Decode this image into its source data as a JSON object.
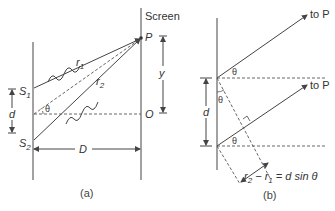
{
  "diagram_a": {
    "caption": "(a)",
    "screen_label": "Screen",
    "point_p": "P",
    "point_o": "O",
    "source_1": "S",
    "source_1_sub": "1",
    "source_2": "S",
    "source_2_sub": "2",
    "ray_1": "r",
    "ray_1_sub": "1",
    "ray_2": "r",
    "ray_2_sub": "2",
    "angle": "θ",
    "separation": "d",
    "distance": "D",
    "height": "y"
  },
  "diagram_b": {
    "caption": "(b)",
    "to_p_top": "to P",
    "to_p_bottom": "to P",
    "angle_top": "θ",
    "angle_mid": "θ",
    "angle_bottom": "θ",
    "separation": "d",
    "path_diff_lhs": "r",
    "path_diff_sub2": "2",
    "path_diff_minus": " − r",
    "path_diff_sub1": "1",
    "path_diff_rhs": " = d sin θ"
  },
  "colors": {
    "line": "#444444",
    "text": "#333333",
    "background": "#ffffff"
  }
}
